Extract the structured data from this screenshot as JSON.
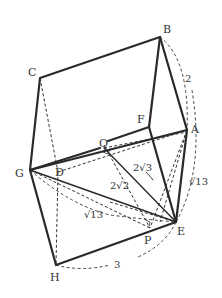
{
  "diagram": {
    "title": "",
    "points": {
      "A": {
        "label": "A",
        "x": 187,
        "y": 130
      },
      "B": {
        "label": "B",
        "x": 160,
        "y": 37
      },
      "C": {
        "label": "C",
        "x": 40,
        "y": 78
      },
      "D": {
        "label": "D",
        "x": 58,
        "y": 172
      },
      "E": {
        "label": "E",
        "x": 176,
        "y": 222
      },
      "F": {
        "label": "F",
        "x": 149,
        "y": 127
      },
      "G": {
        "label": "G",
        "x": 30,
        "y": 170
      },
      "H": {
        "label": "H",
        "x": 56,
        "y": 265
      },
      "P": {
        "label": "P",
        "x": 150,
        "y": 228
      },
      "Q": {
        "label": "Q",
        "x": 104,
        "y": 145
      }
    },
    "measurements": {
      "BA": "2",
      "AE": "√13",
      "GE": "√13",
      "HE": "3",
      "QE": "2√2",
      "QE_arrow": "2√3"
    },
    "labels": {
      "two": "2",
      "sqrt13_right": "√13",
      "sqrt13_left": "√13",
      "three": "3",
      "two_sqrt2": "2√2",
      "two_sqrt3": "2√3"
    },
    "colors": {
      "stroke": "#2a2a2a",
      "background": "#ffffff"
    }
  }
}
